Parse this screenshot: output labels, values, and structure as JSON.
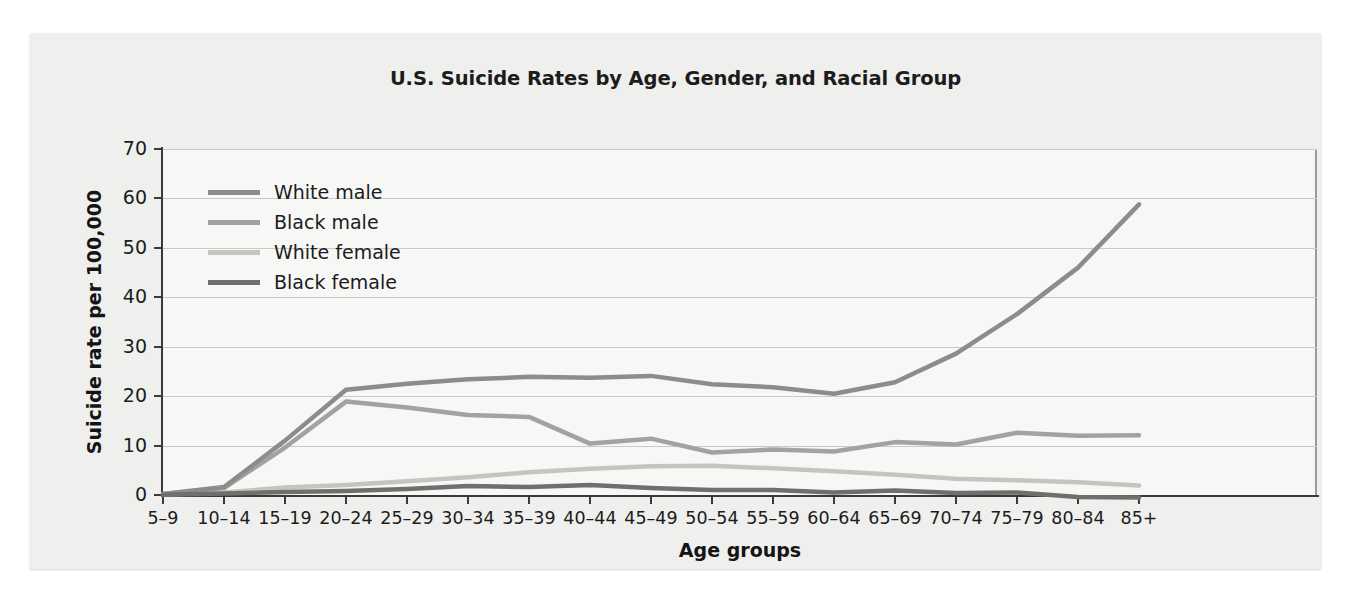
{
  "chart_data": {
    "type": "line",
    "title": "U.S. Suicide Rates by Age, Gender, and Racial Group",
    "xlabel": "Age groups",
    "ylabel": "Suicide rate per 100,000",
    "ylim": [
      0,
      70
    ],
    "yticks": [
      0,
      10,
      20,
      30,
      40,
      50,
      60,
      70
    ],
    "grid": true,
    "legend_position": "upper-left-inside",
    "categories": [
      "5–9",
      "10–14",
      "15–19",
      "20–24",
      "25–29",
      "30–34",
      "35–39",
      "40–44",
      "45–49",
      "50–54",
      "55–59",
      "60–64",
      "65–69",
      "70–74",
      "75–79",
      "80–84",
      "85+"
    ],
    "series": [
      {
        "name": "White male",
        "color": "#8c8c8a",
        "values": [
          0.2,
          1.6,
          11.0,
          21.3,
          22.5,
          23.4,
          23.9,
          23.7,
          24.1,
          22.4,
          21.8,
          20.5,
          22.8,
          28.6,
          36.6,
          46.0,
          58.8
        ]
      },
      {
        "name": "Black male",
        "color": "#a2a2a0",
        "values": [
          0.2,
          1.4,
          9.6,
          18.9,
          17.7,
          16.2,
          15.8,
          10.4,
          11.4,
          8.6,
          9.2,
          8.8,
          10.7,
          10.2,
          12.6,
          12.0,
          12.1
        ]
      },
      {
        "name": "White female",
        "color": "#c4c4c1",
        "values": [
          0.1,
          0.5,
          1.5,
          2.0,
          2.8,
          3.6,
          4.6,
          5.3,
          5.8,
          5.9,
          5.4,
          4.8,
          4.1,
          3.3,
          3.0,
          2.6,
          1.9
        ]
      },
      {
        "name": "Black female",
        "color": "#6f6f6d",
        "values": [
          0.05,
          0.3,
          0.6,
          0.8,
          1.2,
          1.8,
          1.6,
          2.0,
          1.4,
          1.0,
          1.0,
          0.5,
          0.9,
          0.4,
          0.5,
          -0.4,
          -0.5
        ]
      }
    ]
  }
}
